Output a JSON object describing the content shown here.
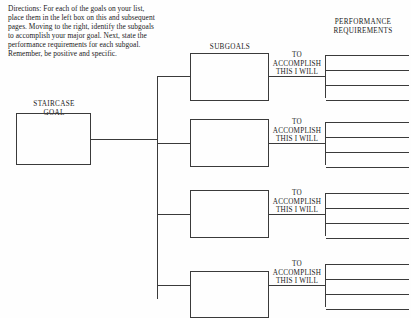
{
  "worksheet": {
    "directions": "Directions: For each of the goals on your list, place them in the left box on this and subsequent pages. Moving to the right, identify the subgoals to accomplish your major goal. Next, state the performance requirements for each subgoal. Remember, be positive and specific.",
    "headings": {
      "staircase_goal": "STAIRCASE\nGOAL",
      "subgoals": "SUBGOALS",
      "performance_requirements": "PERFORMANCE\nREQUIREMENTS"
    },
    "accomplish_caption": "TO\nACCOMPLISH\nTHIS I WILL",
    "goal_box_value": "",
    "subgoal_boxes": [
      {
        "value": ""
      },
      {
        "value": ""
      },
      {
        "value": ""
      },
      {
        "value": ""
      }
    ],
    "requirement_groups": [
      {
        "lines": [
          "",
          "",
          ""
        ]
      },
      {
        "lines": [
          "",
          "",
          ""
        ]
      },
      {
        "lines": [
          "",
          "",
          ""
        ]
      },
      {
        "lines": [
          "",
          "",
          ""
        ]
      }
    ],
    "colors": {
      "ink": "#1b1b1b",
      "rule": "#3a3a3a",
      "paper": "#fefefe"
    }
  }
}
